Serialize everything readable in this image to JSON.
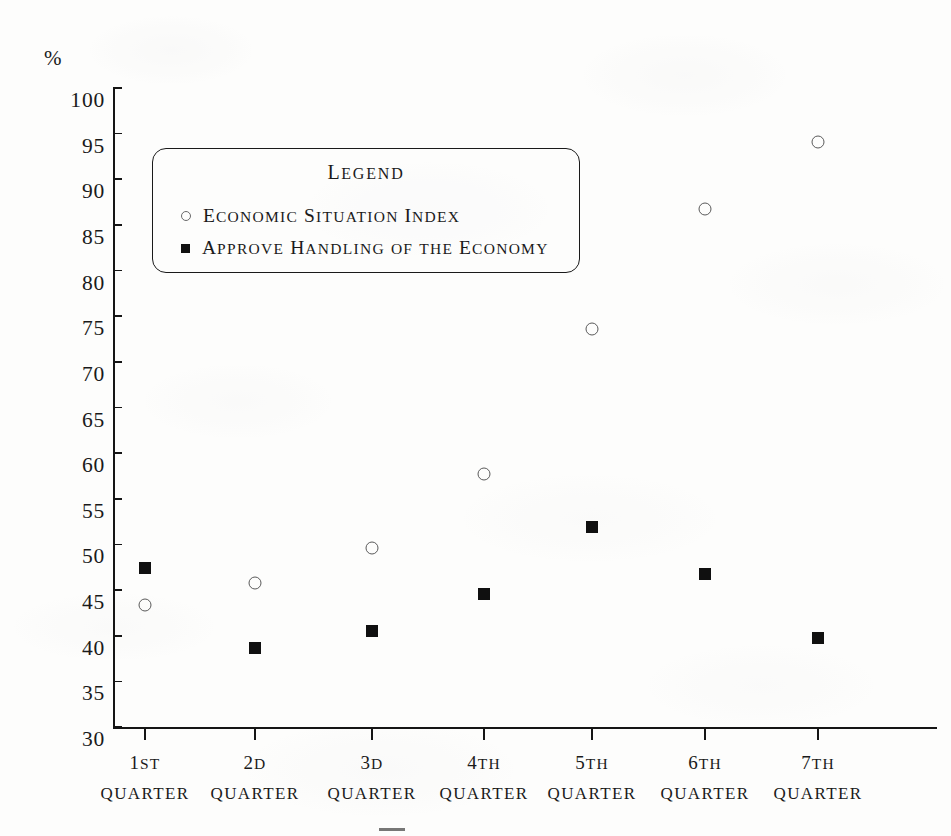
{
  "chart_data": {
    "type": "scatter",
    "title": "",
    "xlabel": "",
    "ylabel": "%",
    "ylim": [
      30,
      100
    ],
    "ytick_step": 5,
    "grid": false,
    "legend_position": "inside-upper-left",
    "categories": [
      "1ST QUARTER",
      "2D QUARTER",
      "3D QUARTER",
      "4TH QUARTER",
      "5TH QUARTER",
      "6TH QUARTER",
      "7TH QUARTER"
    ],
    "x_tick_labels": [
      {
        "num": "1",
        "ord": "ST",
        "line2": "QUARTER"
      },
      {
        "num": "2",
        "ord": "D",
        "line2": "QUARTER"
      },
      {
        "num": "3",
        "ord": "D",
        "line2": "QUARTER"
      },
      {
        "num": "4",
        "ord": "TH",
        "line2": "QUARTER"
      },
      {
        "num": "5",
        "ord": "TH",
        "line2": "QUARTER"
      },
      {
        "num": "6",
        "ord": "TH",
        "line2": "QUARTER"
      },
      {
        "num": "7",
        "ord": "TH",
        "line2": "QUARTER"
      }
    ],
    "y_tick_labels": [
      "100",
      "95",
      "90",
      "85",
      "80",
      "75",
      "70",
      "65",
      "60",
      "55",
      "50",
      "45",
      "40",
      "35",
      "30"
    ],
    "y_tick_values": [
      100,
      95,
      90,
      85,
      80,
      75,
      70,
      65,
      60,
      55,
      50,
      45,
      40,
      35,
      30
    ],
    "series": [
      {
        "name": "ECONOMIC SITUATION INDEX",
        "marker": "open-circle",
        "color": "#5a5a5a",
        "values": [
          43.4,
          45.8,
          49.6,
          57.7,
          73.6,
          86.7,
          94.1
        ]
      },
      {
        "name": "APPROVE HANDLING OF THE ECONOMY",
        "marker": "filled-square",
        "color": "#101010",
        "values": [
          47.4,
          38.7,
          40.5,
          44.6,
          51.9,
          46.8,
          39.8
        ]
      }
    ]
  },
  "legend": {
    "title": "LEGEND",
    "entries": [
      {
        "label": "ECONOMIC SITUATION INDEX",
        "marker": "open-circle"
      },
      {
        "label": "APPROVE HANDLING OF THE ECONOMY",
        "marker": "filled-square"
      }
    ]
  },
  "axis": {
    "y_unit": "%"
  },
  "colors": {
    "ink": "#151515",
    "paper": "#fdfdfc",
    "open_marker": "#5a5a5a",
    "filled_marker": "#101010"
  }
}
